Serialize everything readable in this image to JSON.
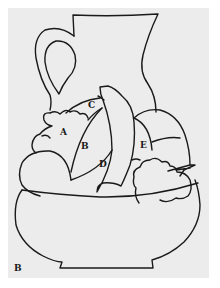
{
  "figure": {
    "panel_label": "B",
    "region_labels": {
      "a": "A",
      "b": "B",
      "c": "C",
      "d": "D",
      "e": "E"
    },
    "colors": {
      "background": "#ececec",
      "line": "#1a1a1a"
    }
  }
}
